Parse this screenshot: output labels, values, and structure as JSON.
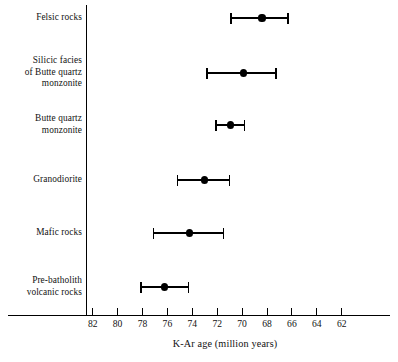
{
  "chart_data": {
    "type": "scatter",
    "title": "",
    "subtitle": "",
    "xlabel": "K-Ar age (million years)",
    "ylabel": "",
    "xlim": [
      82,
      62
    ],
    "x_axis_reversed": true,
    "grid": false,
    "legend": "none",
    "orientation": "horizontal",
    "error_bars": "symmetric-range",
    "xticks": [
      82,
      80,
      78,
      76,
      74,
      72,
      70,
      68,
      66,
      64,
      62
    ],
    "xtick_labels": [
      "82",
      "80",
      "78",
      "76",
      "74",
      "72",
      "70",
      "68",
      "66",
      "64",
      "62"
    ],
    "categories": [
      "Felsic rocks",
      "Silicic facies\nof Butte quartz\nmonzonite",
      "Butte quartz\nmonzonite",
      "Granodiorite",
      "Mafic rocks",
      "Pre-batholith\nvolcanic rocks"
    ],
    "points": [
      {
        "category": "Felsic rocks",
        "value": 68.4,
        "low": 66.3,
        "high": 70.9
      },
      {
        "category": "Silicic facies of Butte quartz monzonite",
        "value": 69.9,
        "low": 67.3,
        "high": 72.8
      },
      {
        "category": "Butte quartz monzonite",
        "value": 70.9,
        "low": 69.8,
        "high": 72.1
      },
      {
        "category": "Granodiorite",
        "value": 73.0,
        "low": 71.0,
        "high": 75.2
      },
      {
        "category": "Mafic rocks",
        "value": 74.2,
        "low": 71.5,
        "high": 77.1
      },
      {
        "category": "Pre-batholith volcanic rocks",
        "value": 76.2,
        "low": 74.3,
        "high": 78.1
      }
    ],
    "colors": {
      "marker": "#000000",
      "error_bar": "#000000",
      "axis": "#000000",
      "text": "#111111",
      "background": "#ffffff"
    }
  }
}
